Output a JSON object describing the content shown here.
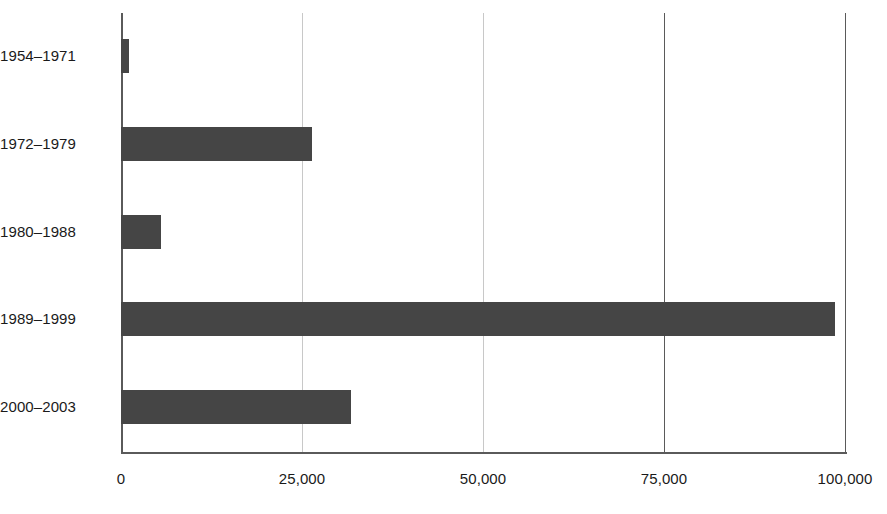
{
  "chart_data": {
    "type": "bar",
    "orientation": "horizontal",
    "title": "",
    "subtitle": "",
    "xlabel": "",
    "ylabel": "",
    "categories": [
      "1954–1971",
      "1972–1979",
      "1980–1988",
      "1989–1999",
      "2000–2003"
    ],
    "values": [
      1100,
      26400,
      5500,
      98600,
      31800
    ],
    "xlim": [
      0,
      100000
    ],
    "xticks": [
      0,
      25000,
      50000,
      75000,
      100000
    ],
    "xtick_labels": [
      "0",
      "25,000",
      "50,000",
      "75,000",
      "100,000"
    ],
    "grid": true,
    "grid_axis": "x",
    "legend": false,
    "legend_position": "none",
    "series": [
      {
        "name": "",
        "values": [
          1100,
          26400,
          5500,
          98600,
          31800
        ]
      }
    ],
    "colors": {
      "bar_fill": "#454545",
      "gridline_minor": "#c8c8c8",
      "gridline_major": "#5a5a5a",
      "axis": "#5a5a5a",
      "text": "#1a1a1a",
      "background": "#ffffff"
    }
  }
}
